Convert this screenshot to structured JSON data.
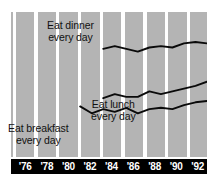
{
  "chart_data": {
    "type": "line",
    "title": "",
    "subtitle": "",
    "xlabel": "",
    "ylabel": "",
    "grid": false,
    "legend_position": "inline-annotations",
    "background": "#b4b4b4",
    "line_color": "#0a0a0a",
    "axis_bar_color": "#000000",
    "axis_label_color": "#ffffff",
    "stripe_color": "#ffffff",
    "x_ticks": [
      "'76",
      "'78",
      "'80",
      "'82",
      "'84",
      "'86",
      "'88",
      "'90",
      "'92"
    ],
    "x_range": [
      1976,
      1993
    ],
    "y_axis_shown": false,
    "series": [
      {
        "name": "Eat dinner every day",
        "label_line1": "Eat dinner",
        "label_line2": "every day",
        "x": [
          1984,
          1985,
          1986,
          1987,
          1988,
          1989,
          1990,
          1991,
          1992,
          1993
        ],
        "values": [
          76,
          78,
          76,
          74,
          77,
          78,
          77,
          80,
          81,
          80
        ]
      },
      {
        "name": "Eat lunch every day",
        "label_line1": "Eat lunch",
        "label_line2": "every day",
        "x": [
          1984,
          1985,
          1986,
          1987,
          1988,
          1989,
          1990,
          1991,
          1992,
          1993
        ],
        "values": [
          40,
          43,
          41,
          41,
          45,
          43,
          45,
          47,
          49,
          52
        ]
      },
      {
        "name": "Eat breakfast every day",
        "label_line1": "Eat breakfast",
        "label_line2": "every day",
        "x": [
          1982,
          1983,
          1984,
          1985,
          1986,
          1987,
          1988,
          1989,
          1990,
          1991,
          1992,
          1993
        ],
        "values": [
          34,
          29,
          32,
          30,
          33,
          29,
          32,
          33,
          32,
          35,
          37,
          38
        ]
      }
    ]
  },
  "axis": {
    "ticks": [
      {
        "label": "'76",
        "left_pct": 4
      },
      {
        "label": "'78",
        "left_pct": 15
      },
      {
        "label": "'80",
        "left_pct": 26
      },
      {
        "label": "'82",
        "left_pct": 37
      },
      {
        "label": "'84",
        "left_pct": 48
      },
      {
        "label": "'86",
        "left_pct": 59
      },
      {
        "label": "'88",
        "left_pct": 70
      },
      {
        "label": "'90",
        "left_pct": 81
      },
      {
        "label": "'92",
        "left_pct": 92
      }
    ]
  },
  "annotations": {
    "dinner_line1": "Eat dinner",
    "dinner_line2": "every day",
    "lunch_line1": "Eat lunch",
    "lunch_line2": "every day",
    "breakfast_line1": "Eat breakfast",
    "breakfast_line2": "every day"
  }
}
